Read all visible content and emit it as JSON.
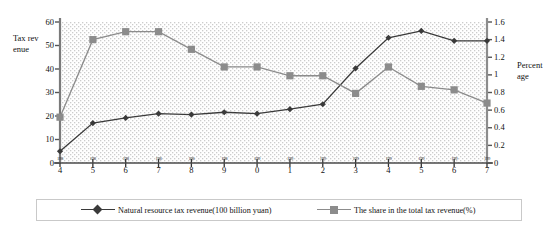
{
  "axis_titles": {
    "left": "Tax revenue",
    "right": "Percentage"
  },
  "legend": {
    "series_a": "Natural resource tax revenue(100 billion yuan)",
    "series_b": "The share in the total tax revenue(%)"
  },
  "colors": {
    "series_a": "#3a3a3a",
    "series_b": "#8c8c8c",
    "axis_left": "#7a7a7a",
    "axis_right": "#8c8c8c",
    "plot_background": "#ffffff",
    "plot_pattern": "#cfcfcf",
    "legend_border": "#c9c9c9"
  },
  "chart_data": {
    "type": "line",
    "title": "",
    "xlabel": "",
    "ylabel": "Tax revenue",
    "y2label": "Percentage",
    "grid": false,
    "pattern_fill": true,
    "legend_position": "bottom",
    "x": [
      1984,
      1985,
      1986,
      1987,
      1988,
      1989,
      1990,
      1991,
      1992,
      1993,
      1994,
      1995,
      1996,
      1997
    ],
    "categories": [
      "1984",
      "1985",
      "1986",
      "1987",
      "1988",
      "1989",
      "1990",
      "1991",
      "1992",
      "1993",
      "1994",
      "1995",
      "1996",
      "1997"
    ],
    "xtick_top": [
      "198",
      "198",
      "198",
      "198",
      "198",
      "198",
      "199",
      "199",
      "199",
      "199",
      "199",
      "199",
      "199",
      "199"
    ],
    "xtick_bottom": [
      "4",
      "5",
      "6",
      "7",
      "8",
      "9",
      "0",
      "1",
      "2",
      "3",
      "4",
      "5",
      "6",
      "7"
    ],
    "ylim": [
      0,
      60
    ],
    "yticks": [
      0,
      10,
      20,
      30,
      40,
      50,
      60
    ],
    "ytick_labels": [
      "0",
      "10",
      "20",
      "30",
      "40",
      "50",
      "60"
    ],
    "y2lim": [
      0,
      1.6
    ],
    "y2ticks": [
      0,
      0.2,
      0.4,
      0.6,
      0.8,
      1.0,
      1.2,
      1.4,
      1.6
    ],
    "y2tick_labels": [
      "0",
      "0.2",
      "0.4",
      "0.6",
      "0.8",
      "1",
      "1.2",
      "1.4",
      "1.6"
    ],
    "series": [
      {
        "name": "Natural resource tax revenue(100 billion yuan)",
        "axis": "left",
        "marker": "diamond",
        "color": "#3a3a3a",
        "values": [
          5.0,
          17.0,
          19.2,
          21.0,
          20.6,
          21.6,
          21.0,
          22.9,
          25.0,
          40.3,
          53.3,
          56.2,
          52.0,
          52.0
        ]
      },
      {
        "name": "The share in the total tax revenue(%)",
        "axis": "right",
        "marker": "square",
        "color": "#8c8c8c",
        "values": [
          0.52,
          1.4,
          1.49,
          1.49,
          1.29,
          1.09,
          1.09,
          0.99,
          0.99,
          0.79,
          1.09,
          0.87,
          0.83,
          0.68
        ]
      }
    ]
  }
}
